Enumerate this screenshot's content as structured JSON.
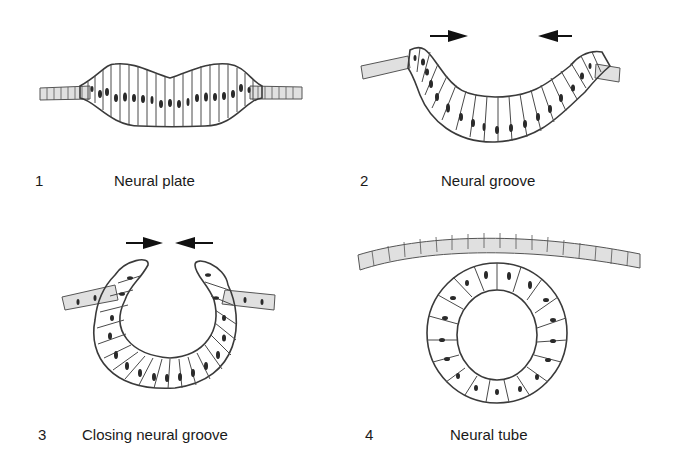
{
  "panels": [
    {
      "number": "1",
      "caption": "Neural plate",
      "arrows": 0
    },
    {
      "number": "2",
      "caption": "Neural groove",
      "arrows": 2
    },
    {
      "number": "3",
      "caption": "Closing neural groove",
      "arrows": 2
    },
    {
      "number": "4",
      "caption": "Neural tube",
      "arrows": 0
    }
  ],
  "colors": {
    "cell_fill": "#d4d4d4",
    "cell_stroke": "#4a4a4a",
    "nucleus": "#2a2a2a",
    "arrow": "#111111",
    "background": "#ffffff"
  }
}
